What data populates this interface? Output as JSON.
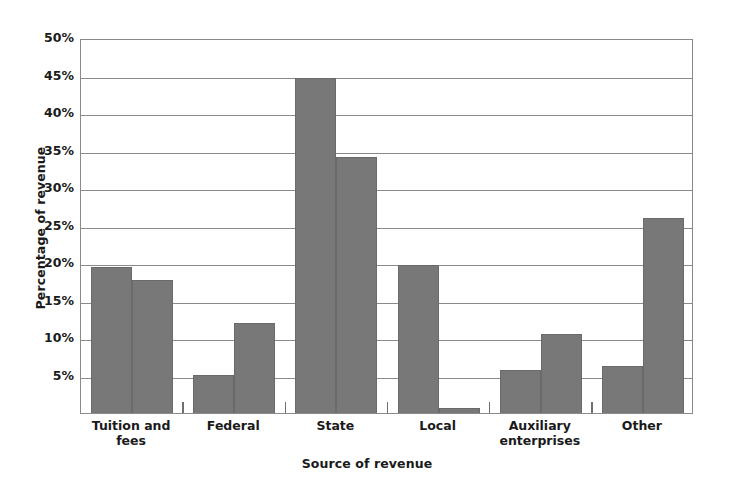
{
  "chart_data": {
    "type": "bar",
    "title": "",
    "xlabel": "Source of revenue",
    "ylabel": "Percentage of revenue",
    "categories": [
      "Tuition and fees",
      "Federal",
      "State",
      "Local",
      "Auxiliary enterprises",
      "Other"
    ],
    "series": [
      {
        "name": "Series 1",
        "values": [
          19.5,
          5.1,
          44.7,
          19.7,
          5.8,
          6.3
        ]
      },
      {
        "name": "Series 2",
        "values": [
          17.7,
          12.0,
          34.2,
          0.7,
          10.6,
          26.0
        ]
      }
    ],
    "ylim": [
      0,
      50
    ],
    "ytick_labels": [
      "50%",
      "45%",
      "40%",
      "35%",
      "30%",
      "25%",
      "20%",
      "15%",
      "10%",
      "5%"
    ],
    "ytick_values": [
      50,
      45,
      40,
      35,
      30,
      25,
      20,
      15,
      10,
      5
    ],
    "grid": true,
    "legend": "none",
    "bar_color": "#787878",
    "axis_color": "#8a8a8a",
    "text_color": "#1a1a1a"
  },
  "axis": {
    "y_title": "Percentage of revenue",
    "x_title": "Source of revenue"
  }
}
